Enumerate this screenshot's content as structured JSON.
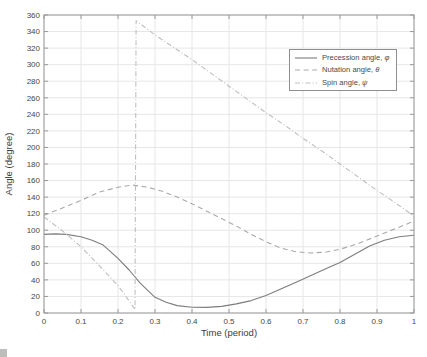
{
  "figure": {
    "background": "#ffffff",
    "axis_color": "#9a9a9a",
    "grid_color": "#e6e6e6",
    "tick_label_color": "#474747"
  },
  "chart_data": {
    "type": "line",
    "title": "",
    "xlabel": "Time (period)",
    "ylabel": "Angle (degree)",
    "xlim": [
      0,
      1
    ],
    "ylim": [
      0,
      360
    ],
    "grid": true,
    "legend_position": "upper-right-inside",
    "x_ticks": [
      0,
      0.1,
      0.2,
      0.3,
      0.4,
      0.5,
      0.6,
      0.7,
      0.8,
      0.9,
      1
    ],
    "x_tick_labels": [
      "0",
      "0.1",
      "0.2",
      "0.3",
      "0.4",
      "0.5",
      "0.6",
      "0.7",
      "0.8",
      "0.9",
      "1"
    ],
    "y_ticks": [
      0,
      20,
      40,
      60,
      80,
      100,
      120,
      140,
      160,
      180,
      200,
      220,
      240,
      260,
      280,
      300,
      320,
      340,
      360
    ],
    "y_tick_labels": [
      "0",
      "20",
      "40",
      "60",
      "80",
      "100",
      "120",
      "140",
      "160",
      "180",
      "200",
      "220",
      "240",
      "260",
      "280",
      "300",
      "320",
      "340",
      "360"
    ],
    "series": [
      {
        "name": "Precession angle",
        "symbol": "φ",
        "line_style": "solid",
        "color": "#7d7d7d",
        "x": [
          0,
          0.03,
          0.06,
          0.1,
          0.13,
          0.16,
          0.2,
          0.23,
          0.26,
          0.3,
          0.33,
          0.36,
          0.4,
          0.44,
          0.48,
          0.52,
          0.56,
          0.6,
          0.64,
          0.68,
          0.72,
          0.76,
          0.8,
          0.84,
          0.88,
          0.92,
          0.96,
          1
        ],
        "y": [
          95,
          95.5,
          95,
          92,
          88,
          82,
          66,
          52,
          36,
          19,
          13,
          9,
          7,
          6.8,
          8,
          11,
          15,
          21,
          29,
          37,
          45,
          53,
          61,
          71,
          81,
          88,
          92,
          94
        ]
      },
      {
        "name": "Nutation angle",
        "symbol": "θ",
        "line_style": "dashed",
        "color": "#a9a9a9",
        "x": [
          0,
          0.05,
          0.1,
          0.15,
          0.2,
          0.24,
          0.28,
          0.32,
          0.36,
          0.4,
          0.44,
          0.48,
          0.52,
          0.56,
          0.6,
          0.64,
          0.68,
          0.72,
          0.76,
          0.8,
          0.85,
          0.9,
          0.95,
          1
        ],
        "y": [
          118,
          127,
          136,
          146,
          152,
          154.5,
          152,
          147,
          140,
          132,
          123,
          114,
          105,
          95,
          86,
          78.5,
          74,
          72.5,
          73.5,
          77,
          84,
          93,
          102,
          111
        ]
      },
      {
        "name": "Spin angle",
        "symbol": "ψ",
        "line_style": "dashdot",
        "color": "#bfbfbf",
        "x": [
          0,
          0.05,
          0.1,
          0.15,
          0.2,
          0.22,
          0.24,
          0.246,
          0.249,
          0.26,
          0.3,
          0.35,
          0.4,
          0.45,
          0.5,
          0.55,
          0.6,
          0.65,
          0.7,
          0.75,
          0.8,
          0.85,
          0.9,
          0.95,
          1
        ],
        "y": [
          116,
          99,
          80,
          57,
          33,
          21,
          8,
          4,
          353,
          349.5,
          336,
          321,
          306,
          290,
          274,
          258,
          242,
          227,
          211,
          196,
          180,
          164,
          148,
          133,
          117
        ]
      }
    ]
  },
  "legend": {
    "items": [
      {
        "label": "Precession angle, ",
        "symbol": "φ"
      },
      {
        "label": "Nutation angle, ",
        "symbol": "θ"
      },
      {
        "label": "Spin angle, ",
        "symbol": "ψ"
      }
    ]
  }
}
